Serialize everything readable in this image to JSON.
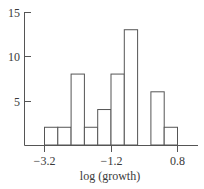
{
  "chart_data": {
    "type": "bar",
    "subtype": "histogram",
    "title": "",
    "xlabel": "log (growth)",
    "ylabel": "",
    "bin_edges": [
      -3.2,
      -2.8,
      -2.4,
      -2.0,
      -1.6,
      -1.2,
      -0.8,
      -0.4,
      0.0,
      0.4,
      0.8
    ],
    "categories": [
      "-3.2 to -2.8",
      "-2.8 to -2.4",
      "-2.4 to -2.0",
      "-2.0 to -1.6",
      "-1.6 to -1.2",
      "-1.2 to -0.8",
      "-0.8 to -0.4",
      "-0.4 to 0.0",
      "0.0 to 0.4",
      "0.4 to 0.8"
    ],
    "values": [
      2,
      2,
      8,
      2,
      4,
      8,
      13,
      0,
      6,
      2
    ],
    "xlim": [
      -3.8,
      1.4
    ],
    "ylim": [
      0,
      15
    ],
    "x_ticks": [
      -3.2,
      -1.2,
      0.8
    ],
    "x_tick_labels": [
      "−3.2",
      "−1.2",
      "0.8"
    ],
    "y_ticks": [
      5,
      10,
      15
    ],
    "y_tick_labels": [
      "5",
      "10",
      "15"
    ],
    "grid": false,
    "legend": null,
    "colors": {
      "bar_fill": "#ffffff",
      "bar_stroke": "#555555",
      "axis": "#555555",
      "text": "#3a3a3a"
    }
  }
}
